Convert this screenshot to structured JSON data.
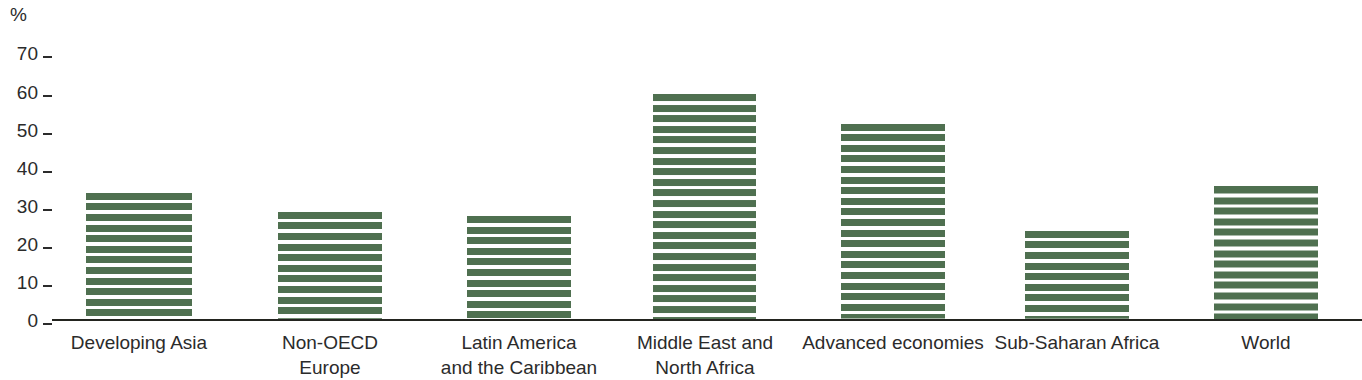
{
  "chart_data": {
    "type": "bar",
    "title": "",
    "subtitle": "",
    "xlabel": "",
    "ylabel": "%",
    "ylim": [
      0,
      70
    ],
    "ytick_values": [
      70,
      60,
      50,
      40,
      30,
      20,
      10,
      0
    ],
    "ytick_labels": [
      "70",
      "60",
      "50",
      "40",
      "30",
      "20",
      "10",
      "0"
    ],
    "grid": false,
    "legend": null,
    "bar_style": "horizontal-striped",
    "bar_color": "#4f7050",
    "axis_color": "#23241f",
    "text_color": "#2b2b2b",
    "categories": [
      "Developing Asia",
      "Non-OECD Europe",
      "Latin America and the Caribbean",
      "Middle East and North Africa",
      "Advanced economies",
      "Sub-Saharan Africa",
      "World"
    ],
    "category_label_lines": [
      [
        "Developing Asia"
      ],
      [
        "Non-OECD",
        "Europe"
      ],
      [
        "Latin America",
        "and the Caribbean"
      ],
      [
        "Middle East and",
        "North Africa"
      ],
      [
        "Advanced economies"
      ],
      [
        "Sub-Saharan Africa"
      ],
      [
        "World"
      ]
    ],
    "values": [
      33,
      28,
      27,
      59,
      51,
      23,
      35
    ],
    "series": [
      {
        "name": "",
        "values": [
          33,
          28,
          27,
          59,
          51,
          23,
          35
        ]
      }
    ]
  },
  "bars": [
    {
      "label": "Developing Asia",
      "value": 33,
      "left": 86,
      "width": 106
    },
    {
      "label": "Non-OECD Europe",
      "value": 28,
      "left": 278,
      "width": 104
    },
    {
      "label": "Latin America",
      "value": 27,
      "left": 467,
      "width": 104
    },
    {
      "label": "Middle East and",
      "value": 59,
      "left": 653,
      "width": 103
    },
    {
      "label": "Advanced economies",
      "value": 51,
      "left": 841,
      "width": 104
    },
    {
      "label": "Sub-Saharan Africa",
      "value": 23,
      "left": 1025,
      "width": 104
    },
    {
      "label": "World",
      "value": 35,
      "left": 1214,
      "width": 104
    }
  ],
  "x_label_positions": [
    {
      "left": 44,
      "width": 190
    },
    {
      "left": 235,
      "width": 190
    },
    {
      "left": 424,
      "width": 190
    },
    {
      "left": 610,
      "width": 190
    },
    {
      "left": 798,
      "width": 190
    },
    {
      "left": 982,
      "width": 190
    },
    {
      "left": 1171,
      "width": 190
    }
  ],
  "y_ticks": [
    {
      "label": "70",
      "top": 42
    },
    {
      "label": "60",
      "top": 81
    },
    {
      "label": "50",
      "top": 119
    },
    {
      "label": "40",
      "top": 157
    },
    {
      "label": "30",
      "top": 195
    },
    {
      "label": "20",
      "top": 233
    },
    {
      "label": "10",
      "top": 271
    },
    {
      "label": "0",
      "top": 309
    }
  ]
}
